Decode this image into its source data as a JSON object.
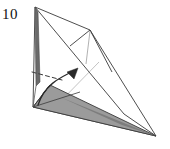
{
  "figure": {
    "step_label": "10",
    "width": 170,
    "height": 149
  },
  "colors": {
    "background": "#ffffff",
    "stroke_dark": "#3a3a3a",
    "stroke_mid": "#6f6f6f",
    "stroke_light": "#b4b4b4",
    "shade_fill": "#9b9b9b",
    "shade_dark_fill": "#7d7d7d",
    "sliver_fill": "#6a6a6a",
    "label_color": "#111111"
  },
  "geometry": {
    "apex": [
      35,
      7
    ],
    "bottom_left": [
      33,
      107
    ],
    "right_tip": [
      156,
      136
    ],
    "inner_peak": [
      90,
      30
    ],
    "inner_peak_left": [
      70,
      46
    ],
    "shade_top": [
      50,
      85
    ],
    "valley_point": [
      124,
      114
    ]
  },
  "shapes": [
    {
      "name": "main-outline-polygon",
      "kind": "polygon",
      "points": "35,7 90,30 156,136 33,107",
      "fill": "none",
      "stroke": "#3a3a3a",
      "stroke_width": 0.9
    },
    {
      "name": "upper-right-flap",
      "kind": "polyline",
      "points": "35,7 124,114 156,136",
      "fill": "none",
      "stroke": "#3a3a3a",
      "stroke_width": 0.9
    },
    {
      "name": "inner-peak-crease",
      "kind": "polyline",
      "points": "70,46 90,30 112,72",
      "fill": "none",
      "stroke": "#3a3a3a",
      "stroke_width": 0.9
    },
    {
      "name": "peak-centre-crease",
      "kind": "line",
      "points": "90,31 86,64",
      "fill": "none",
      "stroke": "#9d9d9d",
      "stroke_width": 0.8
    },
    {
      "name": "light-diagonal-crease",
      "kind": "line",
      "points": "99,62 56,106",
      "fill": "none",
      "stroke": "#b4b4b4",
      "stroke_width": 0.8
    },
    {
      "name": "apex-sliver",
      "kind": "polygon",
      "points": "35,7 38,12 40,82 36,86",
      "fill": "#6a6a6a",
      "stroke": "#4a4a4a",
      "stroke_width": 0.6
    },
    {
      "name": "shaded-wedge",
      "kind": "polygon",
      "points": "33,107 50,85 156,136",
      "fill": "#9b9b9b",
      "stroke": "#3a3a3a",
      "stroke_width": 0.9
    },
    {
      "name": "shaded-wedge-dark-edge",
      "kind": "polygon",
      "points": "60,97 156,136 122,125",
      "fill": "#7d7d7d",
      "stroke": "none",
      "stroke_width": 0
    },
    {
      "name": "wedge-left-crease",
      "kind": "line",
      "points": "50,85 33,107",
      "fill": "none",
      "stroke": "#3a3a3a",
      "stroke_width": 0.9
    },
    {
      "name": "wedge-inner-crease",
      "kind": "line",
      "points": "33,107 80,92",
      "fill": "none",
      "stroke": "#3a3a3a",
      "stroke_width": 0.8
    },
    {
      "name": "vertical-edge-left",
      "kind": "line",
      "points": "36,86 33,107",
      "fill": "none",
      "stroke": "#5a5a5a",
      "stroke_width": 0.8
    }
  ],
  "dashed_fold_line": {
    "name": "valley-fold-dashed-line",
    "points": "32,72 62,80",
    "stroke": "#3a3a3a",
    "stroke_width": 1.0,
    "dash_pattern": "4,3"
  },
  "arrow": {
    "name": "fold-direction-arrow",
    "curve_path": "M 38,105 C 44,86 58,78 76,70",
    "head_points": "78,68 67,72 74,79",
    "stroke": "#2a2a2a",
    "stroke_width": 1.3,
    "fill": "#2a2a2a"
  }
}
